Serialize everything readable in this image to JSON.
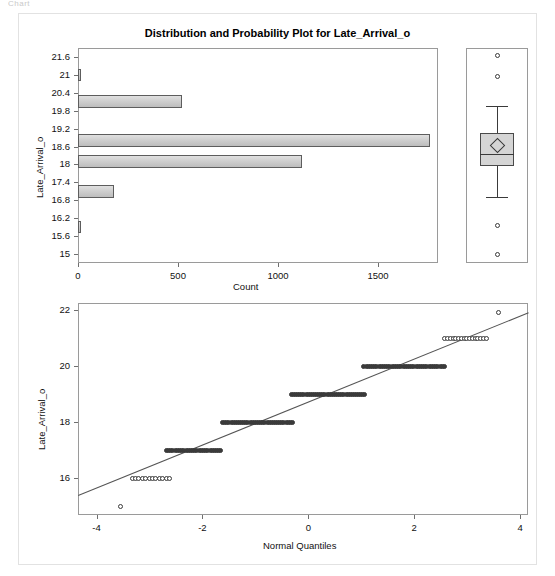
{
  "page": {
    "top_remnant_text": "Chart"
  },
  "chart_data": [
    {
      "type": "bar",
      "orientation": "horizontal",
      "title": "Distribution and Probability Plot for Late_Arrival_o",
      "xlabel": "Count",
      "ylabel": "Late_Arrival_o",
      "xlim": [
        0,
        1800
      ],
      "ylim": [
        14.7,
        21.9
      ],
      "grid": false,
      "xticks": [
        0,
        500,
        1000,
        1500
      ],
      "xtick_labels": [
        "0",
        "500",
        "1000",
        "1500"
      ],
      "yticks": [
        21.6,
        21,
        20.4,
        19.8,
        19.2,
        18.6,
        18,
        17.4,
        16.8,
        16.2,
        15.6,
        15
      ],
      "ytick_labels": [
        "21.6",
        "21",
        "20.4",
        "19.8",
        "19.2",
        "18.6",
        "18",
        "17.4",
        "16.8",
        "16.2",
        "15.6",
        "15"
      ],
      "categories": [
        21.0,
        20.1,
        18.8,
        18.1,
        17.1,
        15.9
      ],
      "values": [
        14,
        520,
        1760,
        1120,
        180,
        12
      ],
      "bar_half_height": 0.21,
      "bar_fill": "#cfcfcf",
      "bar_edge": "#5d5d5d"
    },
    {
      "type": "boxplot",
      "ylabel": "Late_Arrival_o",
      "ylim": [
        14.7,
        21.9
      ],
      "median": 18.35,
      "mean": 18.62,
      "q1": 17.95,
      "q3": 19.05,
      "whisker_low": 16.9,
      "whisker_high": 19.95,
      "outliers": [
        21.65,
        20.95,
        15.95,
        15.0
      ],
      "box_fill": "#d5d5d5",
      "box_edge": "#4a4a4a"
    },
    {
      "type": "scatter",
      "title": "",
      "xlabel": "Normal Quantiles",
      "ylabel": "Late_Arrival_o",
      "xlim": [
        -4.35,
        4.15
      ],
      "ylim": [
        14.7,
        22.25
      ],
      "grid": false,
      "xticks": [
        -4,
        -2,
        0,
        2,
        4
      ],
      "xtick_labels": [
        "-4",
        "-2",
        "0",
        "2",
        "4"
      ],
      "yticks": [
        22,
        20,
        18,
        16
      ],
      "ytick_labels": [
        "22",
        "20",
        "18",
        "16"
      ],
      "reference_line": {
        "x0": -4.35,
        "y0": 15.42,
        "x1": 4.15,
        "y1": 21.92
      },
      "bands": [
        {
          "y": 15.0,
          "x_start": -3.55,
          "x_end": -3.55,
          "n": 1,
          "style": "open"
        },
        {
          "y": 16.0,
          "x_start": -3.33,
          "x_end": -2.62,
          "n": 12,
          "style": "open"
        },
        {
          "y": 17.0,
          "x_start": -2.68,
          "x_end": -1.65,
          "n": 26,
          "style": "filled"
        },
        {
          "y": 18.0,
          "x_start": -1.62,
          "x_end": -0.3,
          "n": 34,
          "style": "filled"
        },
        {
          "y": 19.0,
          "x_start": -0.32,
          "x_end": 1.07,
          "n": 36,
          "style": "filled"
        },
        {
          "y": 20.0,
          "x_start": 1.05,
          "x_end": 2.57,
          "n": 38,
          "style": "filled"
        },
        {
          "y": 21.0,
          "x_start": 2.58,
          "x_end": 3.36,
          "n": 16,
          "style": "open"
        },
        {
          "y": 21.9,
          "x_start": 3.6,
          "x_end": 3.6,
          "n": 1,
          "style": "open"
        }
      ]
    }
  ]
}
